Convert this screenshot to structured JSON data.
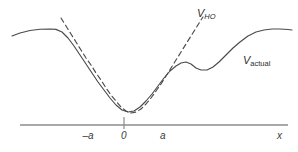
{
  "figure": {
    "title": ""
  },
  "labels": {
    "v_ho_symbol": "V",
    "v_ho_subscript": "HO",
    "v_actual_symbol": "V",
    "v_actual_subscript": "actual",
    "axis_x": "x",
    "tick_minus_a": "–a",
    "tick_zero": "0",
    "tick_a": "a"
  },
  "colors": {
    "curve": "#4a4a4a",
    "dashed": "#4a4a4a",
    "axis": "#8c8c8c",
    "text": "#2e2e2e",
    "background": "#ffffff"
  },
  "chart_data": {
    "type": "line",
    "title": "",
    "xlabel": "x",
    "ylabel": "",
    "grid": false,
    "legend": "inline-annotations",
    "axis": {
      "x_line_start_px": 20,
      "x_line_end_px": 288,
      "x_line_y_px": 125,
      "origin_tick_x_px": 124,
      "origin_tick_top_px": 117,
      "origin_tick_bottom_px": 129
    },
    "xticks": [
      "–a",
      "0",
      "a"
    ],
    "xtick_positions_px": [
      88,
      124,
      163
    ],
    "series": [
      {
        "name": "V_actual",
        "style": "solid",
        "points_px": [
          [
            12,
            36
          ],
          [
            20,
            33
          ],
          [
            30,
            30.5
          ],
          [
            40,
            29.2
          ],
          [
            50,
            29.0
          ],
          [
            56,
            29.4
          ],
          [
            62,
            32
          ],
          [
            68,
            38
          ],
          [
            74,
            46
          ],
          [
            80,
            55
          ],
          [
            86,
            64
          ],
          [
            92,
            73
          ],
          [
            98,
            82
          ],
          [
            104,
            90
          ],
          [
            110,
            98
          ],
          [
            116,
            105
          ],
          [
            122,
            110
          ],
          [
            128,
            112
          ],
          [
            134,
            111
          ],
          [
            140,
            107
          ],
          [
            146,
            101
          ],
          [
            152,
            94
          ],
          [
            158,
            86
          ],
          [
            164,
            78
          ],
          [
            170,
            71
          ],
          [
            176,
            66
          ],
          [
            181,
            63
          ],
          [
            186,
            62
          ],
          [
            191,
            64
          ],
          [
            196,
            68
          ],
          [
            201,
            70
          ],
          [
            207,
            70
          ],
          [
            213,
            67
          ],
          [
            219,
            62
          ],
          [
            226,
            55
          ],
          [
            233,
            48
          ],
          [
            240,
            42
          ],
          [
            248,
            36
          ],
          [
            256,
            32
          ],
          [
            264,
            30
          ],
          [
            272,
            29
          ],
          [
            280,
            29
          ],
          [
            288,
            29.5
          ],
          [
            292,
            30
          ]
        ]
      },
      {
        "name": "V_HO",
        "style": "dashed",
        "points_px": [
          [
            61,
            18
          ],
          [
            66,
            26
          ],
          [
            71,
            34
          ],
          [
            76,
            42
          ],
          [
            81,
            50
          ],
          [
            86,
            58
          ],
          [
            91,
            65
          ],
          [
            96,
            73
          ],
          [
            101,
            80
          ],
          [
            106,
            88
          ],
          [
            111,
            95
          ],
          [
            116,
            101
          ],
          [
            121,
            107
          ],
          [
            126,
            111
          ],
          [
            131,
            113
          ],
          [
            136,
            112
          ],
          [
            141,
            109
          ],
          [
            146,
            104
          ],
          [
            151,
            98
          ],
          [
            156,
            91
          ],
          [
            161,
            84
          ],
          [
            166,
            76
          ],
          [
            171,
            68
          ],
          [
            176,
            60
          ],
          [
            181,
            52
          ],
          [
            186,
            44
          ],
          [
            191,
            36
          ],
          [
            196,
            28
          ],
          [
            201,
            20
          ],
          [
            203,
            17
          ]
        ]
      }
    ]
  }
}
